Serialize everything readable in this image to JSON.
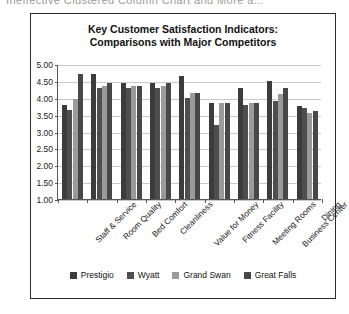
{
  "caption": {
    "text": "Ineffective Clustered Column Chart and More a..."
  },
  "chart_data": {
    "type": "bar",
    "title": "Key Customer Satisfaction Indicators: Comparisons with Major Competitors",
    "title_lines": [
      "Key Customer Satisfaction Indicators:",
      "Comparisons with Major Competitors"
    ],
    "xlabel": "",
    "ylabel": "",
    "ylim": [
      1.0,
      5.0
    ],
    "ytick_labels": [
      "5.00",
      "4.50",
      "4.00",
      "3.50",
      "3.00",
      "2.50",
      "2.00",
      "1.50",
      "1.00"
    ],
    "ytick_values": [
      5.0,
      4.5,
      4.0,
      3.5,
      3.0,
      2.5,
      2.0,
      1.5,
      1.0
    ],
    "grid": true,
    "legend_position": "bottom",
    "categories": [
      "Staff & Service",
      "Room Quality",
      "Bed Comfort",
      "Cleanliness",
      "Value for Money",
      "Fitness Facility",
      "Meeting Rooms",
      "Business Center",
      "Dining"
    ],
    "series": [
      {
        "name": "Prestigio",
        "color": "#3c3c3c",
        "values": [
          3.8,
          4.7,
          4.45,
          4.45,
          4.65,
          3.85,
          4.3,
          4.5,
          3.75
        ]
      },
      {
        "name": "Wyatt",
        "color": "#4e4e4e",
        "values": [
          3.65,
          4.3,
          4.3,
          4.3,
          4.0,
          3.2,
          3.8,
          3.9,
          3.7
        ]
      },
      {
        "name": "Grand Swan",
        "color": "#9a9a9a",
        "values": [
          3.95,
          4.35,
          4.35,
          4.35,
          4.15,
          3.85,
          3.85,
          4.1,
          3.55
        ]
      },
      {
        "name": "Great Falls",
        "color": "#484848",
        "values": [
          4.7,
          4.45,
          4.35,
          4.45,
          4.15,
          3.85,
          3.85,
          4.3,
          3.6
        ]
      }
    ]
  }
}
